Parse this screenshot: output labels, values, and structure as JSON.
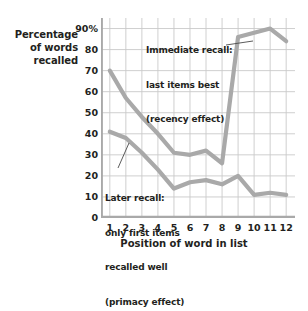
{
  "chart_data": {
    "type": "line",
    "title": "",
    "subtitle": "",
    "xlabel": "Position of word in list",
    "ylabel": "Percentage of words recalled",
    "ylabel_lines": [
      "Percentage",
      "of words",
      "recalled"
    ],
    "categories": [
      1,
      2,
      3,
      4,
      5,
      6,
      7,
      8,
      9,
      10,
      11,
      12
    ],
    "x": [
      1,
      2,
      3,
      4,
      5,
      6,
      7,
      8,
      9,
      10,
      11,
      12
    ],
    "xlim": [
      0.45,
      12.55
    ],
    "ylim": [
      0,
      95
    ],
    "yticks": [
      0,
      10,
      20,
      30,
      40,
      50,
      60,
      70,
      80,
      90
    ],
    "yticklabels": [
      "0",
      "10",
      "20",
      "30",
      "40",
      "50",
      "60",
      "70",
      "80",
      "90%"
    ],
    "xticks": [
      1,
      2,
      3,
      4,
      5,
      6,
      7,
      8,
      9,
      10,
      11,
      12
    ],
    "xticklabels": [
      "1",
      "2",
      "3",
      "4",
      "5",
      "6",
      "7",
      "8",
      "9",
      "10",
      "11",
      "12"
    ],
    "grid": true,
    "legend": "none",
    "line_color": "#a9a9a9",
    "grid_color": "#c9c9c9",
    "axis_color": "#a9a9a9",
    "series": [
      {
        "name": "Immediate recall",
        "color": "#a9a9a9",
        "values": [
          70,
          57,
          48,
          40,
          31,
          30,
          32,
          26,
          86,
          88,
          90,
          84
        ]
      },
      {
        "name": "Later recall",
        "color": "#a9a9a9",
        "values": [
          41,
          38,
          31,
          23,
          14,
          17,
          18,
          16,
          20,
          11,
          12,
          11
        ]
      }
    ],
    "annotations": [
      {
        "name": "immediate-recall-note",
        "lines": [
          "Immediate recall:",
          "last items best",
          "(recency effect)"
        ],
        "leader_from": [
          226,
          45
        ],
        "leader_to": [
          253,
          41
        ]
      },
      {
        "name": "later-recall-note",
        "lines": [
          "Later recall:",
          "only first items",
          "recalled well",
          "(primacy effect)"
        ],
        "leader_from": [
          118,
          168
        ],
        "leader_to": [
          129,
          143
        ]
      }
    ]
  },
  "axes": {
    "y_title_line1": "Percentage",
    "y_title_line2": "of words",
    "y_title_line3": "recalled",
    "x_title": "Position of word in list"
  },
  "ylabels": [
    "90%",
    "80",
    "70",
    "60",
    "50",
    "40",
    "30",
    "20",
    "10",
    "0"
  ],
  "xlabels": [
    "1",
    "2",
    "3",
    "4",
    "5",
    "6",
    "7",
    "8",
    "9",
    "10",
    "11",
    "12"
  ],
  "annotation_top": {
    "l1": "Immediate recall:",
    "l2": "last items best",
    "l3": "(recency effect)"
  },
  "annotation_bottom": {
    "l1": "Later recall:",
    "l2": "only first items",
    "l3": "recalled well",
    "l4": "(primacy effect)"
  }
}
